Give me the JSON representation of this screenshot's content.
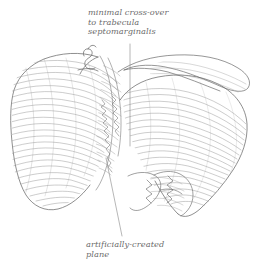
{
  "figure": {
    "kind": "anatomical-line-drawing",
    "background_color": "#ffffff",
    "ink_color": "#8d8d8d",
    "outline_color": "#6e6e6e",
    "label_color": "#6b6b6b"
  },
  "annotations": {
    "top": {
      "name": "minimal-cross-over-label",
      "lines": [
        "minimal cross-over",
        "to trabecula",
        "septomarginalis"
      ],
      "leader": "vertical line descending from label to central cleft"
    },
    "bottom": {
      "name": "artificially-created-plane-label",
      "lines": [
        "artificially-created",
        "plane"
      ],
      "leader": "diagonal line ascending right into central cleft"
    }
  }
}
